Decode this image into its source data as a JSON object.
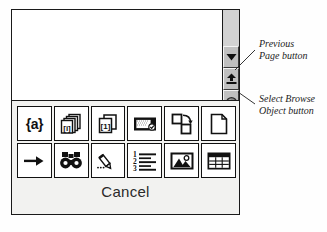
{
  "window": {
    "name": "document-window",
    "background": "#ffffff",
    "border_color": "#1a1a1a"
  },
  "scrollbar": {
    "name": "vertical-scrollbar",
    "track_color": "#d2d2d2",
    "face_color": "#c0c0c0",
    "buttons": [
      {
        "id": "scroll-down",
        "icon": "triangle-down-icon",
        "title": "Scroll Down"
      },
      {
        "id": "previous-page",
        "icon": "double-up-arrow-icon",
        "title": "Previous Page"
      },
      {
        "id": "select-browse-object",
        "icon": "circle-sphere-icon",
        "title": "Select Browse Object"
      }
    ]
  },
  "popup": {
    "name": "select-browse-object-popup",
    "background": "#f2f2f0",
    "cancel_label": "Cancel",
    "items": [
      {
        "id": "browse-by-field",
        "icon": "field-braces-icon",
        "glyph": "{a}"
      },
      {
        "id": "browse-by-endnote",
        "icon": "endnote-stack-icon",
        "glyph": "[i]"
      },
      {
        "id": "browse-by-footnote",
        "icon": "footnote-page-icon",
        "glyph": "[1]"
      },
      {
        "id": "browse-by-comment",
        "icon": "comment-note-icon",
        "glyph": ""
      },
      {
        "id": "browse-by-section",
        "icon": "section-arrow-icon",
        "glyph": ""
      },
      {
        "id": "browse-by-page",
        "icon": "page-icon",
        "glyph": ""
      },
      {
        "id": "go-to",
        "icon": "right-arrow-icon",
        "glyph": ""
      },
      {
        "id": "find",
        "icon": "binoculars-icon",
        "glyph": ""
      },
      {
        "id": "browse-by-edits",
        "icon": "pencil-edits-icon",
        "glyph": ""
      },
      {
        "id": "browse-by-heading",
        "icon": "numbered-list-icon",
        "glyph": "123"
      },
      {
        "id": "browse-by-graphic",
        "icon": "picture-icon",
        "glyph": ""
      },
      {
        "id": "browse-by-table",
        "icon": "table-grid-icon",
        "glyph": ""
      }
    ]
  },
  "annotations": [
    {
      "id": "annotation-previous-page",
      "line1": "Previous",
      "line2": "Page button"
    },
    {
      "id": "annotation-browse-object",
      "line1": "Select Browse",
      "line2": "Object button"
    }
  ]
}
